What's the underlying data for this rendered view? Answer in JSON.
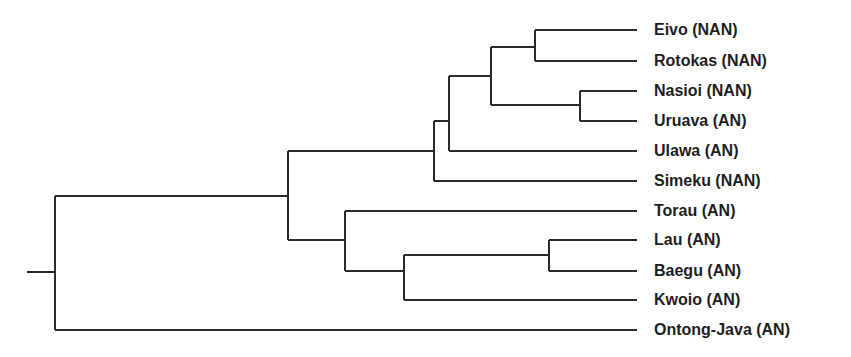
{
  "diagram": {
    "type": "dendrogram",
    "orientation": "left-to-right",
    "line_color": "#2a2a2a",
    "text_color": "#1e1e1e",
    "leaves": [
      {
        "label": "Eivo (NAN)",
        "y": 30
      },
      {
        "label": "Rotokas (NAN)",
        "y": 61
      },
      {
        "label": "Nasioi (NAN)",
        "y": 91
      },
      {
        "label": "Uruava (AN)",
        "y": 121
      },
      {
        "label": "Ulawa (AN)",
        "y": 151
      },
      {
        "label": "Simeku (NAN)",
        "y": 181
      },
      {
        "label": "Torau (AN)",
        "y": 211
      },
      {
        "label": "Lau (AN)",
        "y": 240
      },
      {
        "label": "Baegu (AN)",
        "y": 271
      },
      {
        "label": "Kwoio (AN)",
        "y": 300
      },
      {
        "label": "Ontong-Java (AN)",
        "y": 330
      }
    ],
    "leaf_end_x": 637,
    "root": {
      "stub_x": 27,
      "x": 55,
      "y": 272
    },
    "nodes": [
      {
        "id": "root",
        "x": 55,
        "top": 196,
        "bottom": 330,
        "parent_x": 27,
        "mid": 272
      },
      {
        "id": "n288",
        "x": 288,
        "top": 151,
        "bottom": 240,
        "parent_x": 55,
        "mid": 196
      },
      {
        "id": "n434",
        "x": 434,
        "top": 121,
        "bottom": 181,
        "parent_x": 288,
        "mid": 151
      },
      {
        "id": "n449",
        "x": 449,
        "top": 76,
        "bottom": 151,
        "parent_x": 434,
        "mid": 121
      },
      {
        "id": "n491",
        "x": 491,
        "top": 47,
        "bottom": 105,
        "parent_x": 449,
        "mid": 76
      },
      {
        "id": "n535",
        "x": 535,
        "top": 30,
        "bottom": 61,
        "parent_x": 491,
        "mid": 47
      },
      {
        "id": "n580",
        "x": 580,
        "top": 91,
        "bottom": 121,
        "parent_x": 491,
        "mid": 105
      },
      {
        "id": "n345",
        "x": 345,
        "top": 211,
        "bottom": 271,
        "parent_x": 288,
        "mid": 240
      },
      {
        "id": "n404",
        "x": 404,
        "top": 255,
        "bottom": 300,
        "parent_x": 345,
        "mid": 271
      },
      {
        "id": "n549",
        "x": 549,
        "top": 240,
        "bottom": 271,
        "parent_x": 404,
        "mid": 255
      }
    ],
    "leaf_edges": [
      {
        "leaf": "Eivo (NAN)",
        "from_x": 535,
        "y": 30
      },
      {
        "leaf": "Rotokas (NAN)",
        "from_x": 535,
        "y": 61
      },
      {
        "leaf": "Nasioi (NAN)",
        "from_x": 580,
        "y": 91
      },
      {
        "leaf": "Uruava (AN)",
        "from_x": 580,
        "y": 121
      },
      {
        "leaf": "Ulawa (AN)",
        "from_x": 449,
        "y": 151
      },
      {
        "leaf": "Simeku (NAN)",
        "from_x": 434,
        "y": 181
      },
      {
        "leaf": "Torau (AN)",
        "from_x": 345,
        "y": 211
      },
      {
        "leaf": "Lau (AN)",
        "from_x": 549,
        "y": 240
      },
      {
        "leaf": "Baegu (AN)",
        "from_x": 549,
        "y": 271
      },
      {
        "leaf": "Kwoio (AN)",
        "from_x": 404,
        "y": 300
      },
      {
        "leaf": "Ontong-Java (AN)",
        "from_x": 55,
        "y": 330
      }
    ]
  }
}
